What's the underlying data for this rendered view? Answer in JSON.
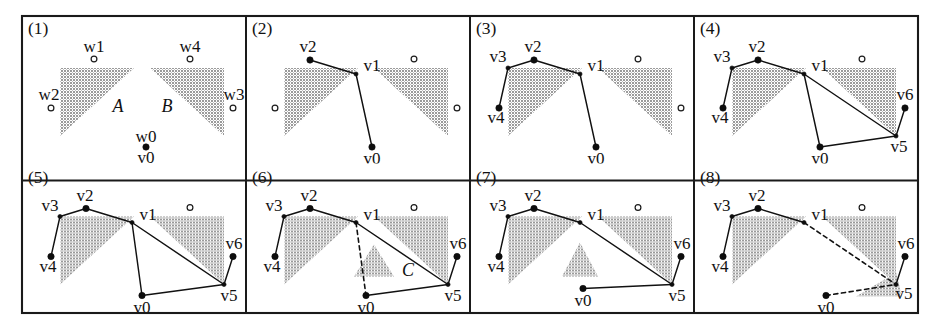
{
  "figure": {
    "panel_count": 8,
    "columns": 4,
    "rows": 2,
    "colors": {
      "obstacle_fill": "#9a9a9a",
      "line": "#111111",
      "frame": "#1a1a1a",
      "background": "#ffffff"
    },
    "geometry": {
      "frame": {
        "x": 22,
        "y": 16,
        "width": 896,
        "height": 297
      },
      "panel_width": 224,
      "panel_height": 148.5,
      "column_dividers": [
        246,
        470,
        694
      ],
      "row_divider": 164.5
    },
    "legend": {
      "filled_node": "path vertex (v)",
      "hollow_node": "candidate point (w)",
      "solid_edge": "current path segment",
      "dashed_edge": "tentative / removed segment"
    }
  },
  "panels": [
    {
      "id": "panel-1",
      "number": "(1)",
      "obstacles": [
        {
          "name": "obstacle-A",
          "points": "38,52 112,52 38,120"
        },
        {
          "name": "obstacle-B",
          "points": "128,52 202,52 202,120"
        }
      ],
      "region_labels": [
        {
          "name": "region-label-A",
          "text": "A",
          "x": 96,
          "y": 96
        },
        {
          "name": "region-label-B",
          "text": "B",
          "x": 145,
          "y": 96
        }
      ],
      "edges": [],
      "dashed_edges": [],
      "nodes": [
        {
          "name": "node-w1",
          "type": "hollow",
          "x": 72,
          "y": 43,
          "label": "w1",
          "lx": 72,
          "ly": 36
        },
        {
          "name": "node-w4",
          "type": "hollow",
          "x": 168,
          "y": 43,
          "label": "w4",
          "lx": 168,
          "ly": 36
        },
        {
          "name": "node-w2",
          "type": "hollow",
          "x": 29,
          "y": 92,
          "label": "w2",
          "lx": 27,
          "ly": 84
        },
        {
          "name": "node-w3",
          "type": "hollow",
          "x": 211,
          "y": 92,
          "label": "w3",
          "lx": 212,
          "ly": 84
        },
        {
          "name": "node-v0",
          "type": "filled",
          "x": 124,
          "y": 131,
          "label": "w0",
          "lx": 124,
          "ly": 126
        },
        {
          "name": "node-v0-label",
          "type": "none",
          "x": 124,
          "y": 131,
          "label": "v0",
          "lx": 124,
          "ly": 147
        }
      ]
    },
    {
      "id": "panel-2",
      "number": "(2)",
      "obstacles": [
        {
          "name": "obstacle-A",
          "points": "38,52 112,52 38,120"
        },
        {
          "name": "obstacle-B",
          "points": "128,52 202,52 202,120"
        }
      ],
      "region_labels": [],
      "edges": [
        {
          "name": "edge-v2-v1",
          "points": "64,44 110,58"
        },
        {
          "name": "edge-v1-v0",
          "points": "110,58 126,131"
        }
      ],
      "dashed_edges": [],
      "nodes": [
        {
          "name": "node-v2",
          "type": "filled",
          "x": 64,
          "y": 44,
          "label": "v2",
          "lx": 62,
          "ly": 36
        },
        {
          "name": "node-v1",
          "type": "vertex",
          "x": 110,
          "y": 58,
          "label": "v1",
          "lx": 126,
          "ly": 55
        },
        {
          "name": "node-v0",
          "type": "filled",
          "x": 126,
          "y": 131,
          "label": "v0",
          "lx": 126,
          "ly": 148
        },
        {
          "name": "node-w1",
          "type": "hollow",
          "x": 168,
          "y": 43,
          "label": "",
          "lx": 0,
          "ly": 0
        },
        {
          "name": "node-w2",
          "type": "hollow",
          "x": 29,
          "y": 92,
          "label": "",
          "lx": 0,
          "ly": 0
        },
        {
          "name": "node-w3",
          "type": "hollow",
          "x": 211,
          "y": 92,
          "label": "",
          "lx": 0,
          "ly": 0
        }
      ]
    },
    {
      "id": "panel-3",
      "number": "(3)",
      "obstacles": [
        {
          "name": "obstacle-A",
          "points": "38,52 112,52 38,120"
        },
        {
          "name": "obstacle-B",
          "points": "128,52 202,52 202,120"
        }
      ],
      "region_labels": [],
      "edges": [
        {
          "name": "edge-v4-v3",
          "points": "29,92 38,52"
        },
        {
          "name": "edge-v3-v2",
          "points": "38,52 64,44"
        },
        {
          "name": "edge-v2-v1",
          "points": "64,44 110,58"
        },
        {
          "name": "edge-v1-v0",
          "points": "110,58 126,131"
        }
      ],
      "dashed_edges": [],
      "nodes": [
        {
          "name": "node-v2",
          "type": "filled",
          "x": 64,
          "y": 44,
          "label": "v2",
          "lx": 63,
          "ly": 36
        },
        {
          "name": "node-v3",
          "type": "vertex",
          "x": 38,
          "y": 52,
          "label": "v3",
          "lx": 28,
          "ly": 46
        },
        {
          "name": "node-v1",
          "type": "vertex",
          "x": 110,
          "y": 58,
          "label": "v1",
          "lx": 126,
          "ly": 55
        },
        {
          "name": "node-v4",
          "type": "filled",
          "x": 29,
          "y": 92,
          "label": "v4",
          "lx": 26,
          "ly": 107
        },
        {
          "name": "node-v0",
          "type": "filled",
          "x": 126,
          "y": 131,
          "label": "v0",
          "lx": 126,
          "ly": 148
        },
        {
          "name": "node-w1",
          "type": "hollow",
          "x": 168,
          "y": 43,
          "label": "",
          "lx": 0,
          "ly": 0
        },
        {
          "name": "node-w3",
          "type": "hollow",
          "x": 211,
          "y": 92,
          "label": "",
          "lx": 0,
          "ly": 0
        }
      ]
    },
    {
      "id": "panel-4",
      "number": "(4)",
      "obstacles": [
        {
          "name": "obstacle-A",
          "points": "38,52 112,52 38,120"
        },
        {
          "name": "obstacle-B",
          "points": "128,52 202,52 202,120"
        }
      ],
      "region_labels": [],
      "edges": [
        {
          "name": "edge-v4-v3",
          "points": "29,92 38,52"
        },
        {
          "name": "edge-v3-v2",
          "points": "38,52 64,44"
        },
        {
          "name": "edge-v2-v1",
          "points": "64,44 110,58"
        },
        {
          "name": "edge-v1-v0",
          "points": "110,58 126,131"
        },
        {
          "name": "edge-v1-v5",
          "points": "110,58 202,120"
        },
        {
          "name": "edge-v0-v5",
          "points": "126,131 202,120"
        },
        {
          "name": "edge-v5-v6",
          "points": "202,120 211,92"
        }
      ],
      "dashed_edges": [],
      "nodes": [
        {
          "name": "node-v2",
          "type": "filled",
          "x": 64,
          "y": 44,
          "label": "v2",
          "lx": 63,
          "ly": 36
        },
        {
          "name": "node-v3",
          "type": "vertex",
          "x": 38,
          "y": 52,
          "label": "v3",
          "lx": 28,
          "ly": 46
        },
        {
          "name": "node-v1",
          "type": "vertex",
          "x": 110,
          "y": 58,
          "label": "v1",
          "lx": 126,
          "ly": 55
        },
        {
          "name": "node-v4",
          "type": "filled",
          "x": 29,
          "y": 92,
          "label": "v4",
          "lx": 26,
          "ly": 107
        },
        {
          "name": "node-v0",
          "type": "filled",
          "x": 126,
          "y": 131,
          "label": "v0",
          "lx": 126,
          "ly": 148
        },
        {
          "name": "node-v5",
          "type": "vertex",
          "x": 202,
          "y": 120,
          "label": "v5",
          "lx": 205,
          "ly": 136
        },
        {
          "name": "node-v6",
          "type": "filled",
          "x": 211,
          "y": 92,
          "label": "v6",
          "lx": 211,
          "ly": 84
        },
        {
          "name": "node-w1",
          "type": "hollow",
          "x": 168,
          "y": 43,
          "label": "",
          "lx": 0,
          "ly": 0
        }
      ]
    },
    {
      "id": "panel-5",
      "number": "(5)",
      "obstacles": [
        {
          "name": "obstacle-A",
          "points": "38,52 112,52 38,120"
        },
        {
          "name": "obstacle-B",
          "points": "128,52 202,52 202,120"
        }
      ],
      "region_labels": [],
      "edges": [
        {
          "name": "edge-v4-v3",
          "points": "29,92 38,52"
        },
        {
          "name": "edge-v3-v2",
          "points": "38,52 64,44"
        },
        {
          "name": "edge-v2-v1",
          "points": "64,44 110,58"
        },
        {
          "name": "edge-v1-v0",
          "points": "110,58 120,131"
        },
        {
          "name": "edge-v1-v5",
          "points": "110,58 202,120"
        },
        {
          "name": "edge-v0-v5",
          "points": "120,131 202,120"
        },
        {
          "name": "edge-v5-v6",
          "points": "202,120 211,92"
        }
      ],
      "dashed_edges": [],
      "nodes": [
        {
          "name": "node-v2",
          "type": "filled",
          "x": 64,
          "y": 44,
          "label": "v2",
          "lx": 63,
          "ly": 36
        },
        {
          "name": "node-v3",
          "type": "vertex",
          "x": 38,
          "y": 52,
          "label": "v3",
          "lx": 28,
          "ly": 46
        },
        {
          "name": "node-v1",
          "type": "vertex",
          "x": 110,
          "y": 58,
          "label": "v1",
          "lx": 126,
          "ly": 55
        },
        {
          "name": "node-v4",
          "type": "filled",
          "x": 29,
          "y": 92,
          "label": "v4",
          "lx": 26,
          "ly": 107
        },
        {
          "name": "node-v0",
          "type": "filled",
          "x": 120,
          "y": 131,
          "label": "v0",
          "lx": 120,
          "ly": 148
        },
        {
          "name": "node-v5",
          "type": "vertex",
          "x": 202,
          "y": 120,
          "label": "v5",
          "lx": 207,
          "ly": 136
        },
        {
          "name": "node-v6",
          "type": "filled",
          "x": 211,
          "y": 92,
          "label": "v6",
          "lx": 212,
          "ly": 84
        },
        {
          "name": "node-w1",
          "type": "hollow",
          "x": 168,
          "y": 43,
          "label": "",
          "lx": 0,
          "ly": 0
        }
      ]
    },
    {
      "id": "panel-6",
      "number": "(6)",
      "obstacles": [
        {
          "name": "obstacle-A",
          "points": "38,52 112,52 38,120"
        },
        {
          "name": "obstacle-B",
          "points": "128,52 202,52 202,120"
        },
        {
          "name": "obstacle-C",
          "points": "128,80 148,112 108,112"
        }
      ],
      "region_labels": [
        {
          "name": "region-label-C",
          "text": "C",
          "x": 162,
          "y": 111
        }
      ],
      "edges": [
        {
          "name": "edge-v4-v3",
          "points": "29,92 38,52"
        },
        {
          "name": "edge-v3-v2",
          "points": "38,52 64,44"
        },
        {
          "name": "edge-v2-v1",
          "points": "64,44 110,58"
        },
        {
          "name": "edge-v1-v5",
          "points": "110,58 202,120"
        },
        {
          "name": "edge-v0-v5",
          "points": "120,131 202,120"
        },
        {
          "name": "edge-v5-v6",
          "points": "202,120 211,92"
        }
      ],
      "dashed_edges": [
        {
          "name": "edge-v1-v0-dashed",
          "points": "110,58 120,131"
        }
      ],
      "nodes": [
        {
          "name": "node-v2",
          "type": "filled",
          "x": 64,
          "y": 44,
          "label": "v2",
          "lx": 63,
          "ly": 36
        },
        {
          "name": "node-v3",
          "type": "vertex",
          "x": 38,
          "y": 52,
          "label": "v3",
          "lx": 28,
          "ly": 46
        },
        {
          "name": "node-v1",
          "type": "vertex",
          "x": 110,
          "y": 58,
          "label": "v1",
          "lx": 126,
          "ly": 55
        },
        {
          "name": "node-v4",
          "type": "filled",
          "x": 29,
          "y": 92,
          "label": "v4",
          "lx": 26,
          "ly": 107
        },
        {
          "name": "node-v0",
          "type": "filled",
          "x": 120,
          "y": 131,
          "label": "v0",
          "lx": 120,
          "ly": 148
        },
        {
          "name": "node-v5",
          "type": "vertex",
          "x": 202,
          "y": 120,
          "label": "v5",
          "lx": 207,
          "ly": 136
        },
        {
          "name": "node-v6",
          "type": "filled",
          "x": 211,
          "y": 92,
          "label": "v6",
          "lx": 212,
          "ly": 84
        },
        {
          "name": "node-w1",
          "type": "hollow",
          "x": 168,
          "y": 43,
          "label": "",
          "lx": 0,
          "ly": 0
        }
      ]
    },
    {
      "id": "panel-7",
      "number": "(7)",
      "obstacles": [
        {
          "name": "obstacle-A",
          "points": "38,52 112,52 38,120"
        },
        {
          "name": "obstacle-B",
          "points": "128,52 202,52 202,120"
        },
        {
          "name": "obstacle-C",
          "points": "110,78 128,112 92,112"
        }
      ],
      "region_labels": [],
      "edges": [
        {
          "name": "edge-v4-v3",
          "points": "29,92 38,52"
        },
        {
          "name": "edge-v3-v2",
          "points": "38,52 64,44"
        },
        {
          "name": "edge-v2-v1",
          "points": "64,44 110,58"
        },
        {
          "name": "edge-v1-v5",
          "points": "110,58 202,120"
        },
        {
          "name": "edge-v0-v5",
          "points": "113,124 202,120"
        },
        {
          "name": "edge-v5-v6",
          "points": "202,120 211,92"
        }
      ],
      "dashed_edges": [],
      "nodes": [
        {
          "name": "node-v2",
          "type": "filled",
          "x": 64,
          "y": 44,
          "label": "v2",
          "lx": 63,
          "ly": 36
        },
        {
          "name": "node-v3",
          "type": "vertex",
          "x": 38,
          "y": 52,
          "label": "v3",
          "lx": 28,
          "ly": 46
        },
        {
          "name": "node-v1",
          "type": "vertex",
          "x": 110,
          "y": 58,
          "label": "v1",
          "lx": 126,
          "ly": 55
        },
        {
          "name": "node-v4",
          "type": "filled",
          "x": 29,
          "y": 92,
          "label": "v4",
          "lx": 26,
          "ly": 107
        },
        {
          "name": "node-v0",
          "type": "filled",
          "x": 113,
          "y": 124,
          "label": "v0",
          "lx": 113,
          "ly": 141
        },
        {
          "name": "node-v5",
          "type": "vertex",
          "x": 202,
          "y": 120,
          "label": "v5",
          "lx": 207,
          "ly": 136
        },
        {
          "name": "node-v6",
          "type": "filled",
          "x": 211,
          "y": 92,
          "label": "v6",
          "lx": 212,
          "ly": 84
        },
        {
          "name": "node-w1",
          "type": "hollow",
          "x": 168,
          "y": 43,
          "label": "",
          "lx": 0,
          "ly": 0
        }
      ]
    },
    {
      "id": "panel-8",
      "number": "(8)",
      "obstacles": [
        {
          "name": "obstacle-A",
          "points": "38,52 112,52 38,120"
        },
        {
          "name": "obstacle-B",
          "points": "128,52 202,52 202,120"
        },
        {
          "name": "obstacle-C",
          "points": "202,108 208,132 162,132"
        }
      ],
      "region_labels": [],
      "edges": [
        {
          "name": "edge-v4-v3",
          "points": "29,92 38,52"
        },
        {
          "name": "edge-v3-v2",
          "points": "38,52 64,44"
        },
        {
          "name": "edge-v2-v1",
          "points": "64,44 110,58"
        },
        {
          "name": "edge-v5-v6",
          "points": "202,120 211,92"
        }
      ],
      "dashed_edges": [
        {
          "name": "edge-v1-v5-dashed",
          "points": "110,58 202,120"
        },
        {
          "name": "edge-v0-v5-dashed",
          "points": "132,131 202,120"
        }
      ],
      "nodes": [
        {
          "name": "node-v2",
          "type": "filled",
          "x": 64,
          "y": 44,
          "label": "v2",
          "lx": 63,
          "ly": 36
        },
        {
          "name": "node-v3",
          "type": "vertex",
          "x": 38,
          "y": 52,
          "label": "v3",
          "lx": 28,
          "ly": 46
        },
        {
          "name": "node-v1",
          "type": "vertex",
          "x": 110,
          "y": 58,
          "label": "v1",
          "lx": 126,
          "ly": 55
        },
        {
          "name": "node-v4",
          "type": "filled",
          "x": 29,
          "y": 92,
          "label": "v4",
          "lx": 26,
          "ly": 107
        },
        {
          "name": "node-v0",
          "type": "filled",
          "x": 132,
          "y": 131,
          "label": "v0",
          "lx": 132,
          "ly": 148
        },
        {
          "name": "node-v5",
          "type": "vertex",
          "x": 202,
          "y": 120,
          "label": "v5",
          "lx": 210,
          "ly": 134
        },
        {
          "name": "node-v6",
          "type": "filled",
          "x": 211,
          "y": 92,
          "label": "v6",
          "lx": 212,
          "ly": 84
        },
        {
          "name": "node-w1",
          "type": "hollow",
          "x": 168,
          "y": 43,
          "label": "",
          "lx": 0,
          "ly": 0
        }
      ]
    }
  ]
}
